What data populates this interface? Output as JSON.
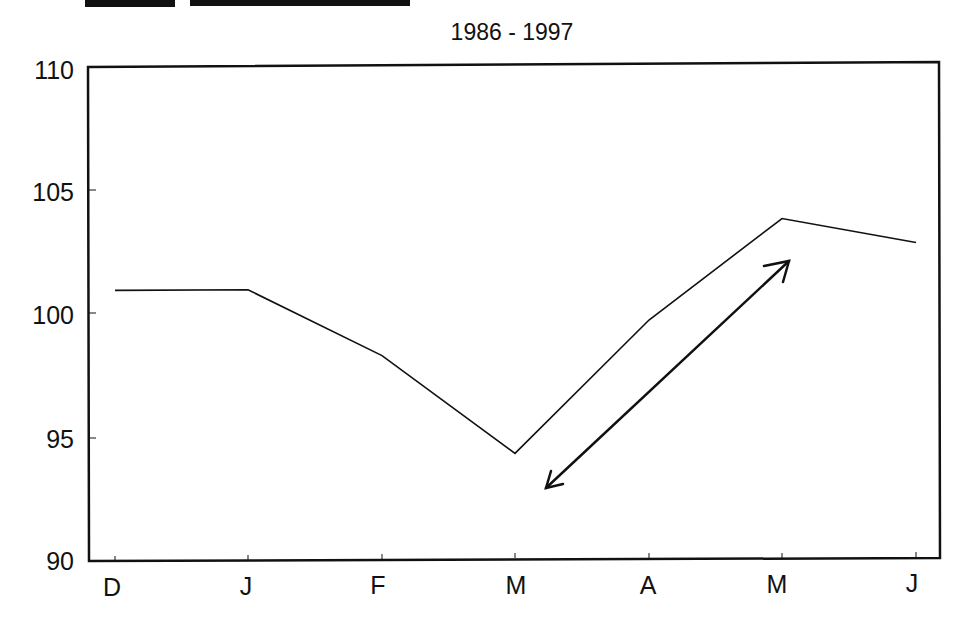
{
  "chart_data": {
    "type": "line",
    "subtitle": "1986 - 1997",
    "categories": [
      "D",
      "J",
      "F",
      "M",
      "A",
      "M",
      "J"
    ],
    "series": [
      {
        "name": "Seasonal index",
        "values": [
          101.0,
          101.0,
          98.3,
          94.3,
          99.7,
          103.8,
          102.8
        ]
      }
    ],
    "xlabel": "",
    "ylabel": "",
    "ylim": [
      90,
      110
    ],
    "yticks": [
      90,
      95,
      100,
      105,
      110
    ],
    "grid": false,
    "legend": "none",
    "annotations": [
      {
        "type": "double-headed-arrow",
        "from": {
          "category_index": 3.2,
          "value": 92.9
        },
        "to": {
          "category_index": 5.05,
          "value": 102.2
        },
        "description": "Arrow indicating rise from March low to May high"
      }
    ]
  },
  "labels": {
    "subtitle": "1986 - 1997",
    "yticks": [
      "110",
      "105",
      "100",
      "95",
      "90"
    ],
    "xticks": [
      "D",
      "J",
      "F",
      "M",
      "A",
      "M",
      "J"
    ]
  },
  "colors": {
    "line": "#111111",
    "frame": "#111111",
    "background": "#ffffff"
  }
}
